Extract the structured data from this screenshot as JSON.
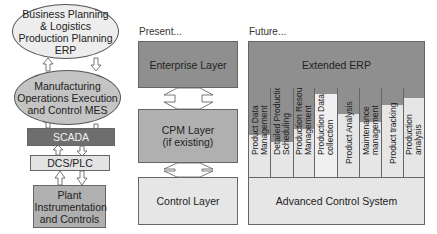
{
  "colors": {
    "dark_gray": "#8f8f8f",
    "scada": "#6e6e6e",
    "mid_gray": "#b0b0b0",
    "light_gray": "#e6e6e6",
    "ellipse_light": "#ededed",
    "ellipse_dark": "#c4c4c4"
  },
  "left_stack": {
    "erp": "Business Planning & Logistics Production Planning ERP",
    "mes": "Manufacturing Operations Execution and Control MES",
    "scada": "SCADA",
    "dcs": "DCS/PLC",
    "plant": "Plant Instrumentation and Controls"
  },
  "present": {
    "heading": "Present...",
    "enterprise": "Enterprise Layer",
    "cpm_line1": "CPM Layer",
    "cpm_line2": "(if existing)",
    "control": "Control Layer"
  },
  "future": {
    "heading": "Future...",
    "extended_erp": "Extended ERP",
    "columns": [
      {
        "label": "Product Data Management",
        "dark_height": 47
      },
      {
        "label": "Detailed Production Scheduling",
        "dark_height": 54
      },
      {
        "label": "Production Resource Management",
        "dark_height": 41
      },
      {
        "label": "Production Data collection",
        "dark_height": 6
      },
      {
        "label": "Product Analysis",
        "dark_height": 26
      },
      {
        "label": "Maintenance management",
        "dark_height": 34
      },
      {
        "label": "Product tracking",
        "dark_height": 17
      },
      {
        "label": "Production analysis",
        "dark_height": 10
      }
    ],
    "acs": "Advanced Control System"
  }
}
